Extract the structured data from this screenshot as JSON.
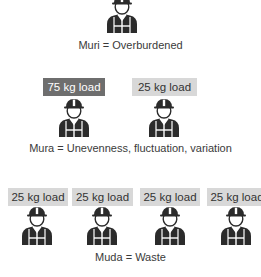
{
  "colors": {
    "icon": "#2b2b2b",
    "load_light_bg": "#d8d8d8",
    "load_dark_bg": "#6e6e6e",
    "text": "#3a3a3a"
  },
  "sections": {
    "muri": {
      "caption": "Muri = Overburdened",
      "workers": [
        {
          "icon": "worker-icon"
        }
      ]
    },
    "mura": {
      "caption": "Mura = Unevenness, fluctuation, variation",
      "loads": [
        {
          "label": "75 kg load",
          "style": "dark"
        },
        {
          "label": "25 kg load",
          "style": "light"
        }
      ]
    },
    "muda": {
      "caption": "Muda = Waste",
      "loads": [
        {
          "label": "25 kg load",
          "style": "light"
        },
        {
          "label": "25 kg load",
          "style": "light"
        },
        {
          "label": "25 kg load",
          "style": "light"
        },
        {
          "label": "25 kg load",
          "style": "light"
        }
      ]
    }
  }
}
